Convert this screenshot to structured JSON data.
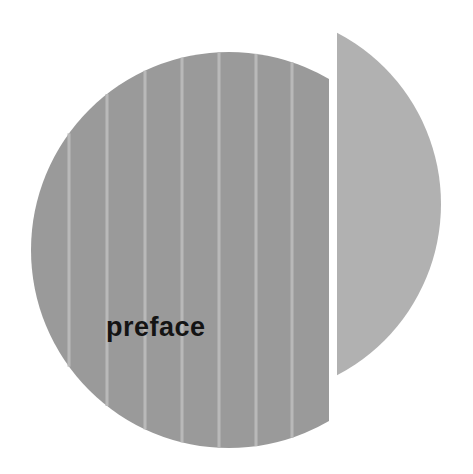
{
  "title_text": "preface",
  "colors": {
    "background": "#ffffff",
    "left_disc": "#9a9a9a",
    "stripe": "#b9b9b9",
    "right_segment": "#b1b1b1",
    "text": "#141414"
  },
  "graphic": {
    "left_disc": {
      "cx": 229,
      "cy": 250,
      "r": 198,
      "cut_x": 329
    },
    "right_segment": {
      "cx": 248,
      "cy": 204,
      "r": 193,
      "start_x": 337
    },
    "stripe_positions_x": [
      69,
      107,
      145,
      182,
      219,
      256,
      292
    ]
  }
}
